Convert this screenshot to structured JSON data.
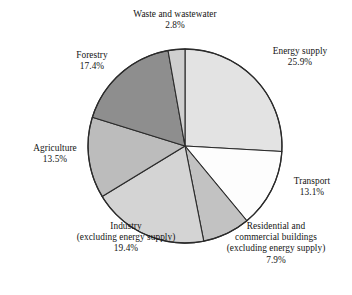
{
  "chart_data": {
    "type": "pie",
    "title": "",
    "subtitle": "",
    "xlabel": "",
    "ylabel": "",
    "legend_position": "none",
    "grid": false,
    "units": "percent",
    "start_angle_deg": 0,
    "direction": "clockwise",
    "categories": [
      "Energy supply",
      "Transport",
      "Residential and commercial buildings (excluding energy supply)",
      "Industry (excluding energy supply)",
      "Agriculture",
      "Forestry",
      "Waste and wastewater"
    ],
    "values": [
      25.9,
      13.1,
      7.9,
      19.4,
      13.5,
      17.4,
      2.8
    ],
    "slices": [
      {
        "name": "Energy supply",
        "value": 25.9,
        "value_label": "25.9%",
        "color": "#e3e3e3",
        "label_lines": [
          "Energy supply",
          "25.9%"
        ]
      },
      {
        "name": "Transport",
        "value": 13.1,
        "value_label": "13.1%",
        "color": "#fdfdfd",
        "label_lines": [
          "Transport",
          "13.1%"
        ]
      },
      {
        "name": "Residential and commercial buildings",
        "value": 7.9,
        "value_label": "7.9%",
        "color": "#c2c2c2",
        "label_lines": [
          "Residential and",
          "commercial buildings",
          "(excluding energy supply)",
          "7.9%"
        ]
      },
      {
        "name": "Industry",
        "value": 19.4,
        "value_label": "19.4%",
        "color": "#d4d4d4",
        "label_lines": [
          "Industry",
          "(excluding energy supply)",
          "19.4%"
        ]
      },
      {
        "name": "Agriculture",
        "value": 13.5,
        "value_label": "13.5%",
        "color": "#bcbcbc",
        "label_lines": [
          "Agriculture",
          "13.5%"
        ]
      },
      {
        "name": "Forestry",
        "value": 17.4,
        "value_label": "17.4%",
        "color": "#8e8e8e",
        "label_lines": [
          "Forestry",
          "17.4%"
        ]
      },
      {
        "name": "Waste and wastewater",
        "value": 2.8,
        "value_label": "2.8%",
        "color": "#cfcfcf",
        "label_lines": [
          "Waste and wastewater",
          "2.8%"
        ]
      }
    ],
    "style": {
      "outline_color": "#2b2b2b",
      "outline_width": 1.1,
      "background": "#ffffff",
      "text_color": "#141414"
    },
    "geometry": {
      "center_x": 185,
      "center_y": 146,
      "radius": 97
    }
  }
}
